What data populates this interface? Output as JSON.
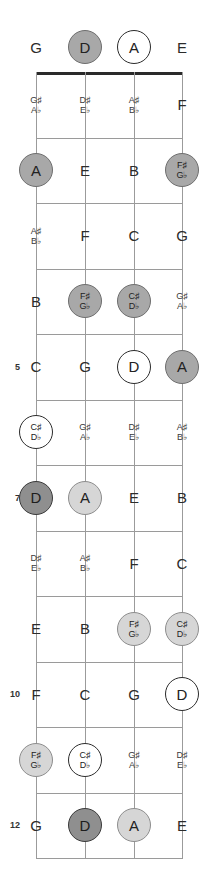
{
  "diagram": {
    "type": "guitar-fretboard",
    "orientation": "vertical",
    "instrument_tuning_top_to_bottom": [
      "G",
      "D",
      "A",
      "E"
    ],
    "string_count": 4,
    "fret_count": 12,
    "marker_legend": {
      "open": "white circle with dark outline",
      "light": "light gray filled circle",
      "mid": "medium gray filled circle",
      "dark": "dark gray filled circle with heavy outline",
      "none": "plain text, no circle"
    },
    "colors": {
      "nut": "#2a2a2a",
      "fret": "#9a9a9a",
      "string": "#9b9b9b",
      "text": "#2b2b2b",
      "marker_open_fill": "#ffffff",
      "marker_light_fill": "#d6d6d6",
      "marker_mid_fill": "#a8a8a8",
      "marker_dark_fill": "#8f8f8f"
    },
    "fret_numbers": [
      {
        "fret": 5,
        "label": "5"
      },
      {
        "fret": 7,
        "label": "7"
      },
      {
        "fret": 10,
        "label": "10"
      },
      {
        "fret": 12,
        "label": "12"
      }
    ],
    "rows": [
      {
        "fret": 0,
        "notes": [
          {
            "text": "G",
            "sharp": "",
            "flat": "",
            "marker": "none"
          },
          {
            "text": "D",
            "sharp": "",
            "flat": "",
            "marker": "mid"
          },
          {
            "text": "A",
            "sharp": "",
            "flat": "",
            "marker": "open"
          },
          {
            "text": "E",
            "sharp": "",
            "flat": "",
            "marker": "none"
          }
        ]
      },
      {
        "fret": 1,
        "notes": [
          {
            "text": "",
            "sharp": "G♯",
            "flat": "A♭",
            "marker": "none"
          },
          {
            "text": "",
            "sharp": "D♯",
            "flat": "E♭",
            "marker": "none"
          },
          {
            "text": "",
            "sharp": "A♯",
            "flat": "B♭",
            "marker": "none"
          },
          {
            "text": "F",
            "sharp": "",
            "flat": "",
            "marker": "none"
          }
        ]
      },
      {
        "fret": 2,
        "notes": [
          {
            "text": "A",
            "sharp": "",
            "flat": "",
            "marker": "mid"
          },
          {
            "text": "E",
            "sharp": "",
            "flat": "",
            "marker": "none"
          },
          {
            "text": "B",
            "sharp": "",
            "flat": "",
            "marker": "none"
          },
          {
            "text": "",
            "sharp": "F♯",
            "flat": "G♭",
            "marker": "mid"
          }
        ]
      },
      {
        "fret": 3,
        "notes": [
          {
            "text": "",
            "sharp": "A♯",
            "flat": "B♭",
            "marker": "none"
          },
          {
            "text": "F",
            "sharp": "",
            "flat": "",
            "marker": "none"
          },
          {
            "text": "C",
            "sharp": "",
            "flat": "",
            "marker": "none"
          },
          {
            "text": "G",
            "sharp": "",
            "flat": "",
            "marker": "none"
          }
        ]
      },
      {
        "fret": 4,
        "notes": [
          {
            "text": "B",
            "sharp": "",
            "flat": "",
            "marker": "none"
          },
          {
            "text": "",
            "sharp": "F♯",
            "flat": "G♭",
            "marker": "mid"
          },
          {
            "text": "",
            "sharp": "C♯",
            "flat": "D♭",
            "marker": "mid"
          },
          {
            "text": "",
            "sharp": "G♯",
            "flat": "A♭",
            "marker": "none"
          }
        ]
      },
      {
        "fret": 5,
        "notes": [
          {
            "text": "C",
            "sharp": "",
            "flat": "",
            "marker": "none"
          },
          {
            "text": "G",
            "sharp": "",
            "flat": "",
            "marker": "none"
          },
          {
            "text": "D",
            "sharp": "",
            "flat": "",
            "marker": "open"
          },
          {
            "text": "A",
            "sharp": "",
            "flat": "",
            "marker": "mid"
          }
        ]
      },
      {
        "fret": 6,
        "notes": [
          {
            "text": "",
            "sharp": "C♯",
            "flat": "D♭",
            "marker": "open"
          },
          {
            "text": "",
            "sharp": "G♯",
            "flat": "A♭",
            "marker": "none"
          },
          {
            "text": "",
            "sharp": "D♯",
            "flat": "E♭",
            "marker": "none"
          },
          {
            "text": "",
            "sharp": "A♯",
            "flat": "B♭",
            "marker": "none"
          }
        ]
      },
      {
        "fret": 7,
        "notes": [
          {
            "text": "D",
            "sharp": "",
            "flat": "",
            "marker": "dark"
          },
          {
            "text": "A",
            "sharp": "",
            "flat": "",
            "marker": "light"
          },
          {
            "text": "E",
            "sharp": "",
            "flat": "",
            "marker": "none"
          },
          {
            "text": "B",
            "sharp": "",
            "flat": "",
            "marker": "none"
          }
        ]
      },
      {
        "fret": 8,
        "notes": [
          {
            "text": "",
            "sharp": "D♯",
            "flat": "E♭",
            "marker": "none"
          },
          {
            "text": "",
            "sharp": "A♯",
            "flat": "B♭",
            "marker": "none"
          },
          {
            "text": "F",
            "sharp": "",
            "flat": "",
            "marker": "none"
          },
          {
            "text": "C",
            "sharp": "",
            "flat": "",
            "marker": "none"
          }
        ]
      },
      {
        "fret": 9,
        "notes": [
          {
            "text": "E",
            "sharp": "",
            "flat": "",
            "marker": "none"
          },
          {
            "text": "B",
            "sharp": "",
            "flat": "",
            "marker": "none"
          },
          {
            "text": "",
            "sharp": "F♯",
            "flat": "G♭",
            "marker": "light"
          },
          {
            "text": "",
            "sharp": "C♯",
            "flat": "D♭",
            "marker": "light"
          }
        ]
      },
      {
        "fret": 10,
        "notes": [
          {
            "text": "F",
            "sharp": "",
            "flat": "",
            "marker": "none"
          },
          {
            "text": "C",
            "sharp": "",
            "flat": "",
            "marker": "none"
          },
          {
            "text": "G",
            "sharp": "",
            "flat": "",
            "marker": "none"
          },
          {
            "text": "D",
            "sharp": "",
            "flat": "",
            "marker": "open"
          }
        ]
      },
      {
        "fret": 11,
        "notes": [
          {
            "text": "",
            "sharp": "F♯",
            "flat": "G♭",
            "marker": "light"
          },
          {
            "text": "",
            "sharp": "C♯",
            "flat": "D♭",
            "marker": "open"
          },
          {
            "text": "",
            "sharp": "G♯",
            "flat": "A♭",
            "marker": "none"
          },
          {
            "text": "",
            "sharp": "D♯",
            "flat": "E♭",
            "marker": "none"
          }
        ]
      },
      {
        "fret": 12,
        "notes": [
          {
            "text": "G",
            "sharp": "",
            "flat": "",
            "marker": "none"
          },
          {
            "text": "D",
            "sharp": "",
            "flat": "",
            "marker": "dark"
          },
          {
            "text": "A",
            "sharp": "",
            "flat": "",
            "marker": "light"
          },
          {
            "text": "E",
            "sharp": "",
            "flat": "",
            "marker": "none"
          }
        ]
      }
    ]
  },
  "geometry": {
    "string_x": [
      36,
      85,
      134,
      182
    ],
    "nut_y": 72,
    "fret_spacing": 65.5,
    "open_row_y": 47
  }
}
